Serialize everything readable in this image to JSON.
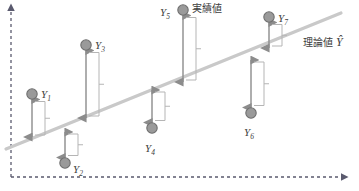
{
  "figure": {
    "colors": {
      "axis": "#5a5a6e",
      "regression_line": "#c9c9c9",
      "marker_fill": "#9a9a9a",
      "marker_stroke": "#6f6f6f",
      "arrow": "#8c8c8c",
      "bracket": "#b5b5b5",
      "text": "#404040"
    }
  },
  "axes": {
    "y_axis": {
      "name": "y-axis",
      "style": "dashed",
      "arrow": "up"
    },
    "x_axis": {
      "name": "x-axis",
      "style": "dashed",
      "arrow": "right"
    }
  },
  "annotations": {
    "actual_value_label": "実績値",
    "theoretical_value_label": "理論値",
    "theoretical_value_symbol": "Ŷ"
  },
  "chart_data": {
    "type": "scatter",
    "title": "",
    "xlabel": "",
    "ylabel": "",
    "grid": false,
    "legend": [
      "実績値",
      "理論値 Ŷ"
    ],
    "regression_line": {
      "x1": 6,
      "y1": 149,
      "x2": 341,
      "y2": 13
    },
    "points": [
      {
        "label": "Y1",
        "sub": "1",
        "x": 32,
        "y": 94,
        "line_y": 137,
        "residual_dir": "above",
        "label_x": 41,
        "label_y": 89
      },
      {
        "label": "Y2",
        "sub": "2",
        "x": 65,
        "y": 163,
        "line_y": 132,
        "residual_dir": "below",
        "label_x": 73,
        "label_y": 164
      },
      {
        "label": "Y3",
        "sub": "3",
        "x": 86,
        "y": 45,
        "line_y": 118,
        "residual_dir": "above",
        "label_x": 95,
        "label_y": 40
      },
      {
        "label": "Y4",
        "sub": "4",
        "x": 152,
        "y": 128,
        "line_y": 90,
        "residual_dir": "below",
        "label_x": 145,
        "label_y": 143
      },
      {
        "label": "Y5",
        "sub": "5",
        "x": 183,
        "y": 10,
        "line_y": 82,
        "residual_dir": "above",
        "label_x": 160,
        "label_y": 7
      },
      {
        "label": "Y6",
        "sub": "6",
        "x": 251,
        "y": 113,
        "line_y": 60,
        "residual_dir": "below",
        "label_x": 244,
        "label_y": 127
      },
      {
        "label": "Y7",
        "sub": "7",
        "x": 269,
        "y": 17,
        "line_y": 48,
        "residual_dir": "above",
        "label_x": 278,
        "label_y": 13
      }
    ]
  }
}
